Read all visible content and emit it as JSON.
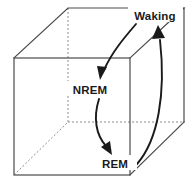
{
  "diagram": {
    "background_color": "#ffffff",
    "line_color": "#4a4a4a",
    "hidden_line_color": "#8c8c8c",
    "arrow_color": "#1a1a1a",
    "text_color": "#1a1a1a",
    "labels": {
      "waking": "Waking",
      "nrem": "NREM",
      "rem": "REM"
    },
    "states": [
      {
        "id": "waking",
        "label": "Waking",
        "x": 155,
        "y": 16
      },
      {
        "id": "nrem",
        "label": "NREM",
        "x": 90,
        "y": 90
      },
      {
        "id": "rem",
        "label": "REM",
        "x": 115,
        "y": 163
      }
    ],
    "transitions": [
      {
        "id": "waking-to-nrem",
        "from": "Waking",
        "to": "NREM"
      },
      {
        "id": "nrem-to-rem",
        "from": "NREM",
        "to": "REM"
      },
      {
        "id": "rem-to-waking",
        "from": "REM",
        "to": "Waking"
      }
    ],
    "cube": {
      "front_face": {
        "x": 14,
        "y": 58,
        "width": 116,
        "height": 117
      },
      "depth_offset_x": 54,
      "depth_offset_y": -53,
      "visible_edges": "front square, top-left diagonal, top-right diagonal, top-back edge, right-back diagonal, back-right vertical",
      "hidden_edges": "back-left vertical, back-bottom horizontal, bottom-left diagonal"
    }
  }
}
